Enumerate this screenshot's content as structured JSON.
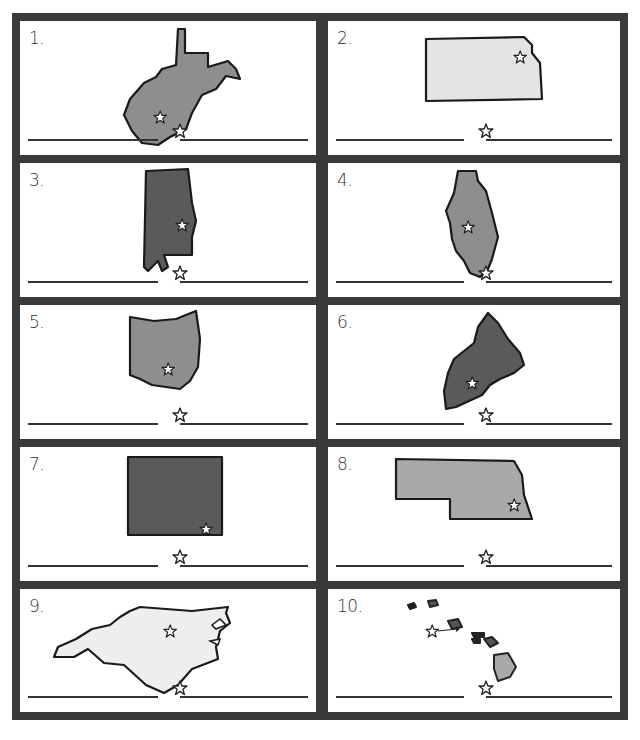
{
  "worksheet": {
    "border_color": "#3a3a3a",
    "cells": [
      {
        "number": "1.",
        "state": "West Virginia",
        "fill": "#8e8e8e",
        "has_capital_star": true
      },
      {
        "number": "2.",
        "state": "Kansas",
        "fill": "#e4e4e4",
        "has_capital_star": true
      },
      {
        "number": "3.",
        "state": "Alabama",
        "fill": "#5a5a5a",
        "has_capital_star": true
      },
      {
        "number": "4.",
        "state": "Illinois",
        "fill": "#8e8e8e",
        "has_capital_star": true
      },
      {
        "number": "5.",
        "state": "Ohio",
        "fill": "#8e8e8e",
        "has_capital_star": true
      },
      {
        "number": "6.",
        "state": "Maine",
        "fill": "#5a5a5a",
        "has_capital_star": true
      },
      {
        "number": "7.",
        "state": "Colorado",
        "fill": "#5a5a5a",
        "has_capital_star": true
      },
      {
        "number": "8.",
        "state": "Nebraska",
        "fill": "#a9a9a9",
        "has_capital_star": true
      },
      {
        "number": "9.",
        "state": "North Carolina",
        "fill": "#eeeeee",
        "has_capital_star": true
      },
      {
        "number": "10.",
        "state": "Hawaii",
        "fill": "#a9a9a9",
        "has_capital_star": true
      }
    ],
    "answer_blanks": {
      "state_name": "",
      "capital_name": ""
    }
  }
}
